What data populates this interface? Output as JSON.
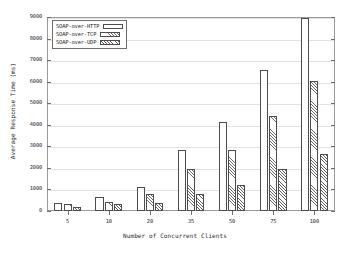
{
  "chart_data": {
    "type": "bar",
    "title": "",
    "xlabel": "Number of Concurrent Clients",
    "ylabel": "Average Response Time (ms)",
    "categories": [
      "5",
      "10",
      "20",
      "35",
      "50",
      "75",
      "100"
    ],
    "ylim": [
      0,
      9000
    ],
    "yticks": [
      0,
      1000,
      2000,
      3000,
      4000,
      5000,
      6000,
      7000,
      8000,
      9000
    ],
    "ytick_labels": [
      "0",
      "1000",
      "2000",
      "3000",
      "4000",
      "5000",
      "6000",
      "7000",
      "8000",
      "9000"
    ],
    "grid": true,
    "legend_position": "top-left",
    "series": [
      {
        "name": "SOAP-over-HTTP",
        "fill": "solid-white",
        "values": [
          380,
          670,
          1120,
          2820,
          4130,
          6530,
          8950
        ]
      },
      {
        "name": "SOAP-over-TCP",
        "fill": "diagonal-hatch",
        "values": [
          320,
          430,
          800,
          1930,
          2820,
          4400,
          6050
        ]
      },
      {
        "name": "SOAP-over-UDP",
        "fill": "cross-hatch",
        "values": [
          200,
          350,
          370,
          800,
          1230,
          1930,
          2650
        ]
      }
    ]
  },
  "colors": {
    "axis": "#6e6e6e",
    "frame": "#9a9a9a",
    "grid": "#e2e2e2",
    "bar_outline": "#4d4d4d",
    "text": "#2b2b2b",
    "background": "#ffffff"
  }
}
